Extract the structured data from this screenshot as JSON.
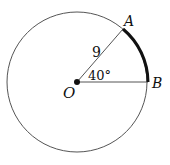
{
  "diagram": {
    "type": "circle-sector",
    "center": {
      "label": "O",
      "x": 77,
      "y": 82
    },
    "radius_px": 70,
    "points": [
      {
        "label": "A",
        "x": 123,
        "y": 29
      },
      {
        "label": "B",
        "x": 148,
        "y": 82
      }
    ],
    "radius_label": "9",
    "angle_label": "40°",
    "highlighted_arc": "AB",
    "colors": {
      "stroke": "#555555",
      "arc": "#111111",
      "dot": "#111111"
    }
  }
}
